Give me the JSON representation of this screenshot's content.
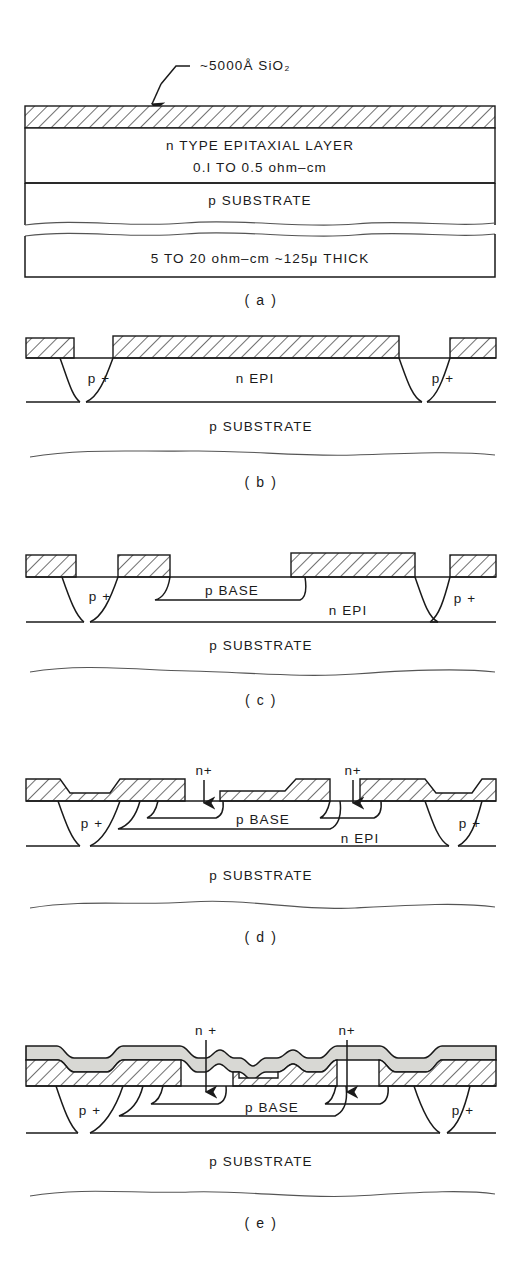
{
  "figure": {
    "domain_note": "five-step process cross-section diagram",
    "panels": [
      {
        "caption": "( a )",
        "step": "a",
        "description": "Starting wafer: oxidized n-type epitaxial layer on p substrate",
        "callout": "~5000Å SiO₂",
        "layers": [
          {
            "name": "oxide",
            "label": ""
          },
          {
            "name": "epi",
            "label_line1": "n   TYPE  EPITAXIAL  LAYER",
            "label_line2": "0.I TO 0.5  ohm–cm"
          },
          {
            "name": "substrate",
            "label": "p SUBSTRATE"
          },
          {
            "name": "substrate-spec",
            "label": "5 TO 20 ohm–cm ~125μ  THICK"
          }
        ]
      },
      {
        "caption": "( b )",
        "step": "b",
        "description": "After isolation diffusion",
        "labels": [
          "p +",
          "n EPI",
          "p +",
          "p SUBSTRATE"
        ],
        "left_iso": "p +",
        "right_iso": "p +",
        "epi": "n EPI",
        "substrate": "p SUBSTRATE"
      },
      {
        "caption": "( c )",
        "step": "c",
        "description": "After base diffusion",
        "left_iso": "p +",
        "base": "p BASE",
        "epi": "n EPI",
        "right_iso": "p +",
        "substrate": "p SUBSTRATE"
      },
      {
        "caption": "( d )",
        "step": "d",
        "description": "After emitter and collector contact n+ diffusion",
        "left_iso": "p +",
        "nplus_left": "n+",
        "base": "p BASE",
        "nplus_right": "n+",
        "epi": "n EPI",
        "right_iso": "p +",
        "substrate": "p SUBSTRATE"
      },
      {
        "caption": "( e )",
        "step": "e",
        "description": "After contact windows and metallization",
        "left_iso": "p +",
        "nplus_left": "n +",
        "base": "p BASE",
        "nplus_right": "n+",
        "right_iso": "p +",
        "substrate": "p SUBSTRATE"
      }
    ],
    "colors": {
      "ink": "#1a1a1a",
      "metal_fill": "#d8d8d4",
      "background": "#ffffff",
      "wavy_break": "#555555"
    }
  }
}
